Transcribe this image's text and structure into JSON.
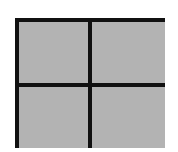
{
  "figure": {
    "type": "grid-icon",
    "rows": 2,
    "columns": 2,
    "colors": {
      "border": "#111111",
      "fill": "#b3b3b3",
      "background": "#ffffff"
    },
    "cells": [
      {
        "row": 1,
        "col": 1
      },
      {
        "row": 1,
        "col": 2
      },
      {
        "row": 2,
        "col": 1
      },
      {
        "row": 2,
        "col": 2
      }
    ]
  }
}
